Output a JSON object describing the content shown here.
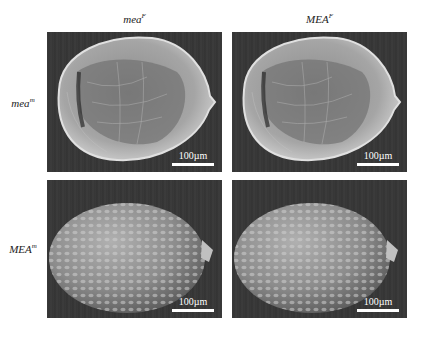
{
  "figure": {
    "columns": [
      {
        "label": "mea",
        "superscript": "F"
      },
      {
        "label": "MEA",
        "superscript": "F"
      }
    ],
    "rows": [
      {
        "label": "mea",
        "superscript": "m"
      },
      {
        "label": "MEA",
        "superscript": "m"
      }
    ],
    "panels": [
      {
        "row": 0,
        "col": 0,
        "phenotype": "collapsed-seed",
        "scale_bar": "100µm"
      },
      {
        "row": 0,
        "col": 1,
        "phenotype": "collapsed-seed",
        "scale_bar": "100µm"
      },
      {
        "row": 1,
        "col": 0,
        "phenotype": "normal-seed",
        "scale_bar": "100µm"
      },
      {
        "row": 1,
        "col": 1,
        "phenotype": "normal-seed",
        "scale_bar": "100µm"
      }
    ],
    "colors": {
      "background": "#ffffff",
      "panel_bg": "#383838",
      "seed": "#b8b8b8",
      "scale_bar": "#ffffff"
    }
  }
}
